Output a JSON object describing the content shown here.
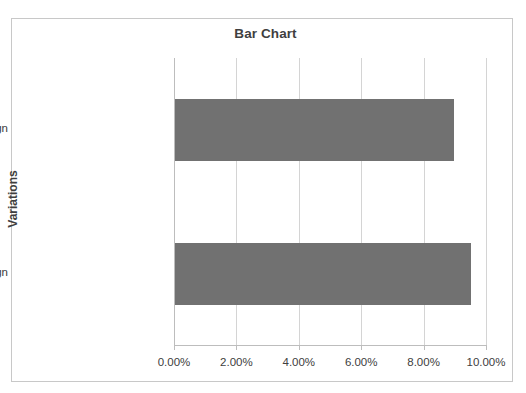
{
  "chart_data": {
    "type": "bar",
    "orientation": "horizontal",
    "title": "Bar Chart",
    "xlabel": "",
    "ylabel": "Variations",
    "categories": [
      "Original web design",
      "New web design"
    ],
    "values": [
      8.95,
      9.5
    ],
    "xlim": [
      0,
      10
    ],
    "xticks": [
      0,
      2,
      4,
      6,
      8,
      10
    ],
    "xtick_labels": [
      "0.00%",
      "2.00%",
      "4.00%",
      "6.00%",
      "8.00%",
      "10.00%"
    ],
    "grid": true,
    "legend": false,
    "series": [
      {
        "name": "Conversion rate",
        "values": [
          8.95,
          9.5
        ],
        "color": "#717171"
      }
    ],
    "colors": {
      "bar": "#717171",
      "gridline": "#d4d4d4",
      "axis": "#bdbdbd",
      "frame": "#c8c8c8",
      "title_text": "#3f3f3f",
      "label_text": "#404040",
      "background": "#ffffff"
    }
  }
}
